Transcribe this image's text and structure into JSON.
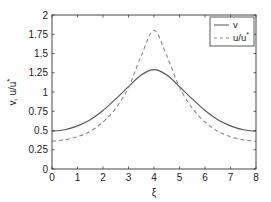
{
  "chart_data": {
    "type": "line",
    "title": "",
    "xlabel": "ξ",
    "ylabel": "v, u/u",
    "ylabel_superscript": "*",
    "xlim": [
      0,
      8
    ],
    "ylim": [
      0,
      2
    ],
    "xticks": [
      0,
      1,
      2,
      3,
      4,
      5,
      6,
      7,
      8
    ],
    "yticks": [
      0,
      0.25,
      0.5,
      0.75,
      1,
      1.25,
      1.5,
      1.75,
      2
    ],
    "xtick_labels": [
      "0",
      "1",
      "2",
      "3",
      "4",
      "5",
      "6",
      "7",
      "8"
    ],
    "ytick_labels": [
      "0",
      "0.25",
      "0.5",
      "0.75",
      "1",
      "1.25",
      "1.5",
      "1.75",
      "2"
    ],
    "grid": false,
    "legend_position": "upper right",
    "x": [
      0,
      0.5,
      1,
      1.5,
      2,
      2.5,
      3,
      3.5,
      4,
      4.5,
      5,
      5.5,
      6,
      6.5,
      7,
      7.5,
      8
    ],
    "series": [
      {
        "name": "v",
        "style": "solid",
        "color": "#555555",
        "values": [
          0.49,
          0.51,
          0.56,
          0.64,
          0.76,
          0.91,
          1.07,
          1.22,
          1.29,
          1.22,
          1.07,
          0.91,
          0.76,
          0.64,
          0.56,
          0.51,
          0.49
        ]
      },
      {
        "name": "u/u",
        "name_superscript": "*",
        "style": "dashed",
        "color": "#888888",
        "values": [
          0.36,
          0.38,
          0.42,
          0.49,
          0.61,
          0.79,
          1.06,
          1.47,
          1.8,
          1.47,
          1.06,
          0.79,
          0.61,
          0.49,
          0.42,
          0.38,
          0.36
        ]
      }
    ]
  },
  "legend": {
    "items": [
      {
        "label": "v",
        "superscript": ""
      },
      {
        "label": "u/u",
        "superscript": "*"
      }
    ]
  }
}
